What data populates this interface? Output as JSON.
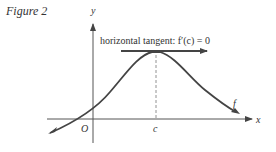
{
  "figure": {
    "title": "Figure 2",
    "annotation": "horizontal tangent: f′(c) = 0",
    "labels": {
      "y_axis": "y",
      "x_axis": "x",
      "origin": "O",
      "c_tick": "c",
      "curve": "f"
    },
    "colors": {
      "curve": "#444444",
      "axes": "#555555",
      "text": "#333333"
    }
  }
}
